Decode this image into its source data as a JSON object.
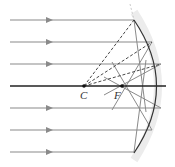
{
  "diagram": {
    "type": "concave-mirror-spherical-aberration",
    "labels": {
      "center_of_curvature": "C",
      "focal_point": "F"
    },
    "colors": {
      "ray": "#888888",
      "axis": "#222222",
      "mirror": "#333333",
      "dashed_normal": "#333333",
      "glow": "#e8e8e8"
    },
    "incident_rays_y": [
      20,
      42,
      64,
      108,
      130,
      152
    ],
    "axis_y": 86,
    "points": {
      "C": [
        84,
        86
      ],
      "F": [
        122,
        86
      ]
    }
  }
}
